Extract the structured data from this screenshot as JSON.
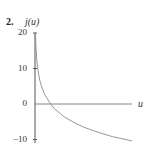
{
  "problem_number": "2.",
  "chart_data": {
    "type": "line",
    "title": "",
    "xlabel": "u",
    "ylabel": "j(u)",
    "ylim": [
      -10,
      20
    ],
    "xlim": [
      0,
      10
    ],
    "yticks": [
      20,
      10,
      0,
      -10
    ],
    "ytick_labels": [
      "20",
      "10",
      "0",
      "−10"
    ],
    "xticks": [],
    "grid": false,
    "legend": null,
    "series": [
      {
        "name": "j(u)",
        "style": "thin gray curve",
        "color": "#888888",
        "x": [
          0.05,
          0.1,
          0.2,
          0.3,
          0.5,
          0.75,
          1.0,
          1.6,
          2.0,
          3.0,
          4.0,
          5.0,
          6.0,
          7.0,
          8.0,
          9.0,
          10.0
        ],
        "values": [
          19.8,
          15.8,
          11.9,
          9.5,
          6.6,
          4.3,
          2.7,
          0.0,
          -1.3,
          -3.6,
          -5.2,
          -6.5,
          -7.5,
          -8.4,
          -9.2,
          -9.8,
          -10.4
        ]
      }
    ]
  }
}
